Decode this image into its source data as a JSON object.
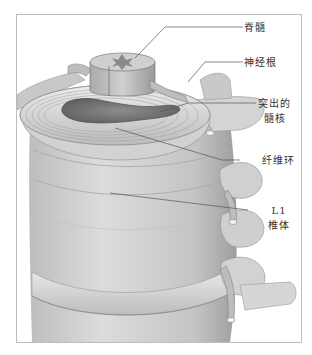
{
  "figure": {
    "type": "anatomical-illustration",
    "palette": {
      "background": "#ffffff",
      "frame": "#bdbdbd",
      "bone_light": "#d9d9d9",
      "bone_mid": "#b5b5b5",
      "bone_dark": "#8a8a8a",
      "nucleus": "#7a7a7a",
      "leader": "#555555",
      "text": "#333333"
    }
  },
  "labels": [
    {
      "id": "spinal-cord",
      "text": "脊髓"
    },
    {
      "id": "nerve-root",
      "text": "神经根"
    },
    {
      "id": "herniated-nucleus",
      "line1": "突出的",
      "line2": "髓核"
    },
    {
      "id": "annulus-fibrosus",
      "text": "纤维环"
    },
    {
      "id": "l1-vertebra",
      "line1": "L1",
      "line2": "椎体"
    }
  ]
}
